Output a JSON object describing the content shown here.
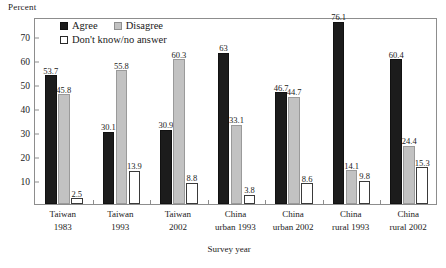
{
  "chart_data": {
    "type": "bar",
    "title": "",
    "ylabel": "Percent",
    "xlabel": "Survey year",
    "ylim": [
      0,
      78
    ],
    "yticks": [
      10,
      20,
      30,
      40,
      50,
      60,
      70
    ],
    "grid": false,
    "legend_position": "top-left-inside",
    "categories": [
      "Taiwan\n1983",
      "Taiwan\n1993",
      "Taiwan\n2002",
      "China\nurban 1993",
      "China\nurban 2002",
      "China\nrural 1993",
      "China\nrural 2002"
    ],
    "category_lines": [
      [
        "Taiwan",
        "1983"
      ],
      [
        "Taiwan",
        "1993"
      ],
      [
        "Taiwan",
        "2002"
      ],
      [
        "China",
        "urban 1993"
      ],
      [
        "China",
        "urban 2002"
      ],
      [
        "China",
        "rural 1993"
      ],
      [
        "China",
        "rural 2002"
      ]
    ],
    "series": [
      {
        "name": "Agree",
        "color": "#1c1c1c",
        "values": [
          53.7,
          30.1,
          30.9,
          63.0,
          46.7,
          76.1,
          60.4
        ]
      },
      {
        "name": "Disagree",
        "color": "#c2c2c2",
        "values": [
          45.8,
          55.8,
          60.3,
          33.1,
          44.7,
          14.1,
          24.4
        ]
      },
      {
        "name": "Don't know/no answer",
        "color": "#ffffff",
        "values": [
          2.5,
          13.9,
          8.8,
          3.8,
          8.6,
          9.8,
          15.3
        ]
      }
    ],
    "value_labels": [
      [
        "53.7",
        "45.8",
        "2.5"
      ],
      [
        "30.1",
        "55.8",
        "13.9"
      ],
      [
        "30.9",
        "60.3",
        "8.8"
      ],
      [
        "63",
        "33.1",
        "3.8"
      ],
      [
        "46.7",
        "44.7",
        "8.6"
      ],
      [
        "76.1",
        "14.1",
        "9.8"
      ],
      [
        "60.4",
        "24.4",
        "15.3"
      ]
    ]
  },
  "legend": {
    "agree": "Agree",
    "disagree": "Disagree",
    "dont_know": "Don't know/no answer"
  },
  "axis": {
    "y_title": "Percent",
    "x_title": "Survey year",
    "y_ticks": [
      "70",
      "60",
      "50",
      "40",
      "30",
      "20",
      "10"
    ]
  }
}
